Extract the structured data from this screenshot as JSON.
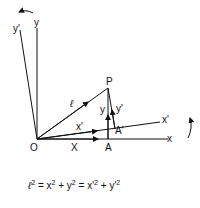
{
  "diagram": {
    "points": {
      "origin": {
        "label": "O"
      },
      "P": {
        "label": "P"
      },
      "A": {
        "label": "A"
      },
      "A_prime": {
        "label": "A'"
      }
    },
    "axes": {
      "x": {
        "label": "x"
      },
      "y": {
        "label": "y"
      },
      "x_prime": {
        "label": "x'"
      },
      "y_prime": {
        "label": "y'"
      }
    },
    "vectors": {
      "ell": {
        "label": "ℓ"
      },
      "X": {
        "label": "X"
      },
      "x_prime_comp": {
        "label": "x'"
      },
      "y_comp": {
        "label": "y"
      },
      "y_prime_comp": {
        "label": "y'"
      }
    },
    "equation": {
      "lhs": "ℓ",
      "part1": "=  x",
      "part2": "+ y",
      "part3": "  =  x'",
      "part4": "+ y'",
      "exp": "2"
    }
  }
}
